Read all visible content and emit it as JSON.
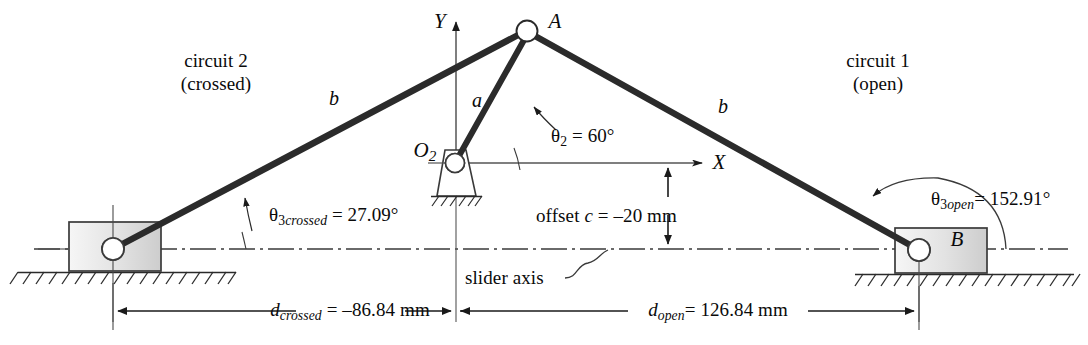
{
  "diagram": {
    "colors": {
      "ink": "#0a0a0a",
      "link": "#2b2b2b",
      "thin_line": "#4a4a4a",
      "block_fill_light": "#f2f2f2",
      "block_fill_dark": "#cfcfcf",
      "block_stroke": "#3a3a3a",
      "background": "#ffffff"
    },
    "labels": {
      "circuit2_line1": "circuit 2",
      "circuit2_line2": "(crossed)",
      "circuit1_line1": "circuit 1",
      "circuit1_line2": "(open)",
      "point_a": "A",
      "point_b": "B",
      "pivot_o2_main": "O",
      "pivot_o2_sub": "2",
      "link_a": "a",
      "link_b_left": "b",
      "link_b_right": "b",
      "axis_y": "Y",
      "axis_x": "X",
      "theta2_sym": "θ",
      "theta2_sub": "2",
      "theta2_value": " = 60°",
      "theta3_crossed_sym": "θ",
      "theta3_crossed_sub_num": "3",
      "theta3_crossed_sub_word": "crossed",
      "theta3_crossed_value": " = 27.09°",
      "theta3_open_sym": "θ",
      "theta3_open_sub_num": "3",
      "theta3_open_sub_word": "open",
      "theta3_open_value": "= 152.91°",
      "offset_prefix": "offset ",
      "offset_var": "c",
      "offset_value": " = –20 mm",
      "slider_axis": "slider axis",
      "d_crossed_var": "d",
      "d_crossed_sub": "crossed",
      "d_crossed_value": " = –86.84 mm",
      "d_open_var": "d",
      "d_open_sub": "open",
      "d_open_value": "= 126.84 mm"
    },
    "values": {
      "theta2_deg": 60,
      "theta3_crossed_deg": 27.09,
      "theta3_open_deg": 152.91,
      "offset_c_mm": -20,
      "d_crossed_mm": -86.84,
      "d_open_mm": 126.84
    },
    "geometry": {
      "point_A": {
        "x": 527,
        "y": 31,
        "r": 10
      },
      "pivot_O2": {
        "x": 455,
        "y": 163,
        "r": 9
      },
      "slider_left_pivot": {
        "x": 113,
        "y": 249,
        "r": 11
      },
      "slider_right_pivot": {
        "x": 919,
        "y": 250,
        "r": 11
      },
      "block_left": {
        "x": 69,
        "y": 222,
        "w": 92,
        "h": 49
      },
      "block_right": {
        "x": 895,
        "y": 228,
        "w": 92,
        "h": 45
      },
      "x_axis_y": 163,
      "y_axis_x": 456,
      "slider_axis_y": 249,
      "offset_arrow_x": 668,
      "dim_line_y": 311
    }
  }
}
